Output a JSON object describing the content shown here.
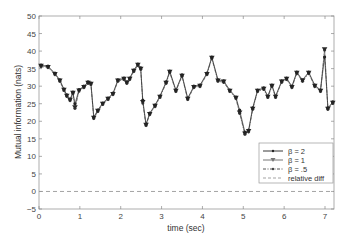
{
  "chart_data": {
    "type": "line",
    "title": "",
    "xlabel": "time (sec)",
    "ylabel": "Mutual information (nats)",
    "xlim": [
      0,
      7.22
    ],
    "ylim": [
      -5,
      50
    ],
    "xticks": [
      0,
      1,
      2,
      3,
      4,
      5,
      6,
      7
    ],
    "yticks": [
      -5,
      0,
      5,
      10,
      15,
      20,
      25,
      30,
      35,
      40,
      45,
      50
    ],
    "grid": false,
    "legend_position": "lower right",
    "x": [
      0.05,
      0.22,
      0.39,
      0.51,
      0.61,
      0.68,
      0.76,
      0.83,
      0.88,
      0.98,
      1.1,
      1.2,
      1.27,
      1.34,
      1.44,
      1.56,
      1.69,
      1.81,
      1.93,
      2.08,
      2.15,
      2.22,
      2.32,
      2.42,
      2.49,
      2.54,
      2.62,
      2.71,
      2.84,
      2.96,
      3.11,
      3.2,
      3.35,
      3.5,
      3.64,
      3.79,
      3.94,
      4.11,
      4.23,
      4.38,
      4.52,
      4.67,
      4.82,
      4.91,
      5.04,
      5.13,
      5.23,
      5.35,
      5.5,
      5.6,
      5.7,
      5.79,
      5.94,
      6.06,
      6.19,
      6.31,
      6.45,
      6.6,
      6.75,
      6.89,
      6.99,
      7.07,
      7.19
    ],
    "series": [
      {
        "name": "β = 2",
        "style": "solid line, dot marker",
        "color": "#222222",
        "values": [
          36,
          35.7,
          33.7,
          31.8,
          29.2,
          27.5,
          26.3,
          28.3,
          25,
          29,
          30,
          31.2,
          30.9,
          21.2,
          23.2,
          25.2,
          26.6,
          28,
          31.8,
          32.3,
          31.2,
          32.3,
          34.6,
          36.3,
          35.2,
          26,
          19.2,
          22.3,
          24.6,
          27.2,
          31.2,
          34.3,
          28.9,
          33.2,
          26.6,
          30,
          30.3,
          33.7,
          38.3,
          31.8,
          31.5,
          28.9,
          26.9,
          23.2,
          16.9,
          17.5,
          23.8,
          28.9,
          29.5,
          27.2,
          30.3,
          27.2,
          31.5,
          32.3,
          30,
          34,
          31.8,
          34,
          30.3,
          28.9,
          38.3,
          23.8,
          25.5
        ]
      },
      {
        "name": "β = 1",
        "style": "solid line, downward triangle marker",
        "color": "#333333",
        "values": [
          35.8,
          35.5,
          33.5,
          31.6,
          29,
          27.3,
          26.1,
          28.1,
          24,
          28.8,
          29.8,
          31,
          30.7,
          21,
          23,
          25,
          26.4,
          27.8,
          31.6,
          32.1,
          31,
          32.1,
          34.4,
          36.1,
          35,
          25.5,
          19,
          22.1,
          24.4,
          27,
          31,
          34.1,
          28.7,
          33,
          26.4,
          29.8,
          30.1,
          33.5,
          38.1,
          31.6,
          31.3,
          28.7,
          26.7,
          22.5,
          16.5,
          17.2,
          23.6,
          28.7,
          29.3,
          27,
          30.1,
          27,
          31.3,
          32.1,
          29.8,
          33.8,
          31.6,
          33.8,
          30.1,
          28.7,
          40.5,
          23.6,
          25.3
        ]
      },
      {
        "name": "β = .5",
        "style": "dash-dot line, dot marker",
        "color": "#444444",
        "values": [
          35.6,
          35.3,
          33.3,
          31.4,
          28.8,
          27.1,
          25.9,
          27.9,
          23.7,
          28.6,
          29.6,
          30.8,
          30.5,
          20.8,
          22.8,
          24.8,
          26.2,
          27.6,
          31.4,
          31.9,
          30.8,
          31.9,
          34.2,
          35.9,
          34.8,
          25.2,
          18.8,
          21.9,
          24.2,
          26.8,
          30.8,
          33.9,
          28.5,
          32.8,
          26.2,
          29.6,
          29.9,
          33.3,
          37.9,
          31.4,
          31.1,
          28.5,
          26.5,
          22.3,
          16.3,
          17,
          23.4,
          28.5,
          29.1,
          26.8,
          29.9,
          26.8,
          31.1,
          31.9,
          29.6,
          33.6,
          31.4,
          33.6,
          29.9,
          28.5,
          40.3,
          23.4,
          25.1
        ]
      },
      {
        "name": "relative diff",
        "style": "dashed line, no marker",
        "color": "#999999",
        "values": [
          0,
          0,
          0,
          0,
          0,
          0,
          0,
          0,
          0,
          0,
          0,
          0,
          0,
          0,
          0,
          0,
          0,
          0,
          0,
          0,
          0,
          0,
          0,
          0,
          0,
          0,
          0,
          0,
          0,
          0,
          0,
          0,
          0,
          0,
          0,
          0,
          0,
          0,
          0,
          0,
          0,
          0,
          0,
          0,
          0,
          0,
          0,
          0,
          0,
          0,
          0,
          0,
          0,
          0,
          0,
          0,
          0,
          0,
          0,
          0,
          0,
          0,
          0
        ]
      }
    ]
  },
  "legend": {
    "items": [
      {
        "label": "β = 2"
      },
      {
        "label": "β = 1"
      },
      {
        "label": "β = .5"
      },
      {
        "label": "relative diff"
      }
    ]
  },
  "axes": {
    "xlabel": "time (sec)",
    "ylabel": "Mutual information (nats)",
    "xtick_labels": [
      "0",
      "1",
      "2",
      "3",
      "4",
      "5",
      "6",
      "7"
    ],
    "ytick_labels": [
      "−5",
      "0",
      "5",
      "10",
      "15",
      "20",
      "25",
      "30",
      "35",
      "40",
      "45",
      "50"
    ]
  }
}
